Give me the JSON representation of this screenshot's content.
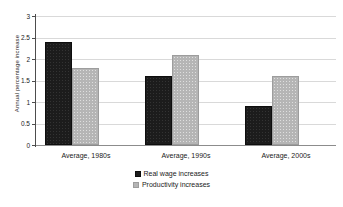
{
  "chart_data": {
    "type": "bar",
    "title": "",
    "subtitle": "",
    "xlabel": "",
    "ylabel": "Annual percentage increase",
    "categories": [
      "Average, 1980s",
      "Average, 1990s",
      "Average, 2000s"
    ],
    "series": [
      {
        "name": "Real wage increases",
        "color": "#1c1c1c",
        "values": [
          2.4,
          1.6,
          0.9
        ]
      },
      {
        "name": "Productivity increases",
        "color": "#b5b5b5",
        "values": [
          1.8,
          2.1,
          1.6
        ]
      }
    ],
    "ylim": [
      0,
      3
    ],
    "yticks": [
      0,
      0.5,
      1,
      1.5,
      2,
      2.5,
      3
    ],
    "ytick_labels": [
      "0",
      "0.5",
      "1",
      "1.5",
      "2",
      "2.5",
      "3"
    ],
    "grid": true,
    "grid_axis": "y",
    "legend": true,
    "legend_position": "bottom"
  },
  "axis": {
    "y_title": "Annual percentage increase",
    "tick_0": "0",
    "tick_1": "0.5",
    "tick_2": "1",
    "tick_3": "1.5",
    "tick_4": "2",
    "tick_5": "2.5",
    "tick_6": "3"
  },
  "categories": {
    "cat_0": "Average, 1980s",
    "cat_1": "Average, 1990s",
    "cat_2": "Average, 2000s"
  },
  "legend": {
    "item_0": "Real wage increases",
    "item_1": "Productivity increases"
  }
}
